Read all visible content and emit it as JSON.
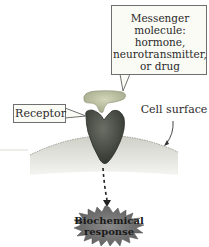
{
  "diagram": {
    "messenger_label": {
      "lines": [
        "Messenger",
        "molecule:",
        "hormone,",
        "neurotransmitter,",
        "or drug"
      ]
    },
    "receptor_label": "Receptor",
    "cell_surface_label": "Cell surface",
    "response_label": {
      "lines": [
        "Biochemical",
        "response"
      ]
    },
    "colors": {
      "messenger": "#b9bd9a",
      "receptor": "#4a4f47",
      "cell_surface": "#cfd1c7",
      "response_burst": "#6e6e6e",
      "callout_fill": "#fbfbf6",
      "callout_border": "#6f6f6f"
    },
    "arrows": [
      {
        "from": "receptor",
        "to": "biochemical-response",
        "style": "dashed"
      },
      {
        "from": "cell-surface-label",
        "to": "cell-surface",
        "style": "solid"
      }
    ]
  }
}
